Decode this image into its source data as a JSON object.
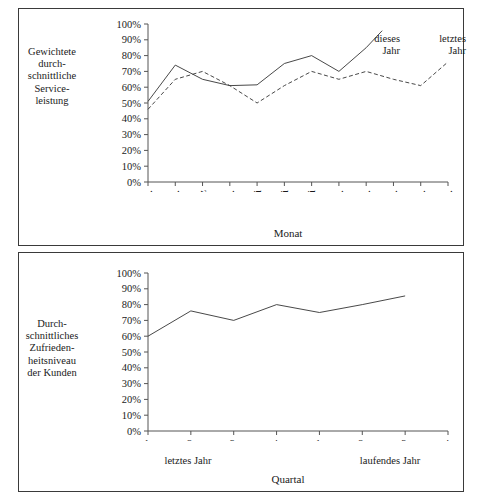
{
  "figure": {
    "caption": ""
  },
  "top_panel": {
    "ylabel": "Gewichtete\ndurch-\nschnittliche\nService-\nleistung",
    "xlabel": "Monat",
    "series_labels": {
      "solid": "dieses\nJahr",
      "dashed": "letztes\nJahr"
    }
  },
  "bottom_panel": {
    "ylabel": "Durch-\nschnittliches\nZufrieden-\nheitsniveau\nder Kunden",
    "xlabel": "Quartal",
    "group_left": "letztes Jahr",
    "group_right": "laufendes Jahr"
  },
  "chart_data": [
    {
      "type": "line",
      "title": "",
      "ylabel": "Gewichtete durchschnittliche Serviceleistung",
      "xlabel": "Monat",
      "categories": [
        "Jan.",
        "Feb.",
        "März",
        "Apr.",
        "Mai",
        "Juni",
        "Juli",
        "Aug.",
        "Sept.",
        "Okt.",
        "Nov.",
        "Dez."
      ],
      "ytick_labels": [
        "0%",
        "10%",
        "20%",
        "30%",
        "40%",
        "50%",
        "60%",
        "70%",
        "80%",
        "90%",
        "100%"
      ],
      "ylim": [
        0,
        100
      ],
      "grid": false,
      "legend_position": "inline-annotation",
      "series": [
        {
          "name": "dieses Jahr",
          "style": "solid",
          "values": [
            51,
            74,
            65,
            61,
            61.5,
            75,
            80,
            70,
            85,
            null,
            null,
            null
          ]
        },
        {
          "name": "letztes Jahr",
          "style": "dashed",
          "values": [
            46,
            65,
            70,
            61,
            50,
            61,
            70,
            65,
            70,
            65,
            61,
            76
          ]
        }
      ]
    },
    {
      "type": "line",
      "title": "",
      "ylabel": "Durchschnittliches Zufriedenheitsniveau der Kunden",
      "xlabel": "Quartal",
      "categories": [
        "1.",
        "2.",
        "3.",
        "4.",
        "1.",
        "2.",
        "3.",
        "4."
      ],
      "group_labels": [
        "letztes Jahr",
        "laufendes Jahr"
      ],
      "ytick_labels": [
        "0%",
        "10%",
        "20%",
        "30%",
        "40%",
        "50%",
        "60%",
        "70%",
        "80%",
        "90%",
        "100%"
      ],
      "ylim": [
        0,
        100
      ],
      "grid": false,
      "series": [
        {
          "name": "Zufriedenheitsniveau",
          "style": "solid",
          "values": [
            60,
            76,
            70,
            80,
            75,
            80,
            85.5,
            null
          ]
        }
      ]
    }
  ]
}
